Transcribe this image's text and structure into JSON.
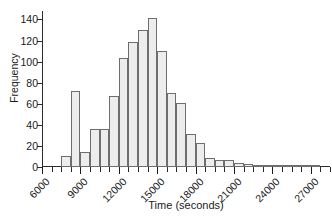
{
  "chart_data": {
    "type": "bar",
    "subtype": "histogram",
    "title": "",
    "xlabel": "Time (seconds)",
    "ylabel": "Frequency",
    "xlim": [
      6000,
      28500
    ],
    "ylim": [
      0,
      148
    ],
    "grid": false,
    "legend": null,
    "bin_width": 750,
    "xticks": [
      6000,
      9000,
      12000,
      15000,
      18000,
      21000,
      24000,
      27000
    ],
    "xtick_labels": [
      "6000",
      "9000",
      "12000",
      "15000",
      "18000",
      "21000",
      "24000",
      "27000"
    ],
    "xminor_ticks": [
      6750,
      7500,
      8250,
      9750,
      10500,
      11250,
      12750,
      13500,
      14250,
      15750,
      16500,
      17250,
      18750,
      19500,
      20250,
      21750,
      22500,
      23250,
      24750,
      25500,
      26250,
      27750,
      28500
    ],
    "yticks": [
      0,
      20,
      40,
      60,
      80,
      100,
      120,
      140
    ],
    "ytick_labels": [
      "0",
      "20",
      "40",
      "60",
      "80",
      "100",
      "120",
      "140"
    ],
    "bin_edges": [
      7500,
      8250,
      9000,
      9750,
      10500,
      11250,
      12000,
      12750,
      13500,
      14250,
      15000,
      15750,
      16500,
      17250,
      18000,
      18750,
      19500,
      20250,
      21000,
      21750,
      22500,
      23250,
      24000,
      24750,
      25500,
      26250,
      27000,
      27750,
      28500
    ],
    "bins": [
      {
        "start": 7500,
        "end": 8250,
        "value": 10
      },
      {
        "start": 8250,
        "end": 9000,
        "value": 72
      },
      {
        "start": 9000,
        "end": 9750,
        "value": 14
      },
      {
        "start": 9750,
        "end": 10500,
        "value": 36
      },
      {
        "start": 10500,
        "end": 11250,
        "value": 36
      },
      {
        "start": 11250,
        "end": 12000,
        "value": 67
      },
      {
        "start": 12000,
        "end": 12750,
        "value": 103
      },
      {
        "start": 12750,
        "end": 13500,
        "value": 119
      },
      {
        "start": 13500,
        "end": 14250,
        "value": 130
      },
      {
        "start": 14250,
        "end": 15000,
        "value": 141
      },
      {
        "start": 15000,
        "end": 15750,
        "value": 110
      },
      {
        "start": 15750,
        "end": 16500,
        "value": 70
      },
      {
        "start": 16500,
        "end": 17250,
        "value": 61
      },
      {
        "start": 17250,
        "end": 18000,
        "value": 31
      },
      {
        "start": 18000,
        "end": 18750,
        "value": 23
      },
      {
        "start": 18750,
        "end": 19500,
        "value": 9
      },
      {
        "start": 19500,
        "end": 20250,
        "value": 7
      },
      {
        "start": 20250,
        "end": 21000,
        "value": 7
      },
      {
        "start": 21000,
        "end": 21750,
        "value": 4
      },
      {
        "start": 21750,
        "end": 22500,
        "value": 3
      },
      {
        "start": 22500,
        "end": 23250,
        "value": 1
      },
      {
        "start": 23250,
        "end": 24000,
        "value": 1
      },
      {
        "start": 24000,
        "end": 24750,
        "value": 1
      },
      {
        "start": 24750,
        "end": 25500,
        "value": 1
      },
      {
        "start": 25500,
        "end": 26250,
        "value": 1
      },
      {
        "start": 26250,
        "end": 27000,
        "value": 1
      },
      {
        "start": 27000,
        "end": 27750,
        "value": 1
      }
    ],
    "colors": {
      "bar_fill": "#ededed",
      "bar_edge": "#6e6e6e",
      "axis": "#2b2b2b",
      "text": "#1a1a1a",
      "background": "#ffffff"
    }
  }
}
